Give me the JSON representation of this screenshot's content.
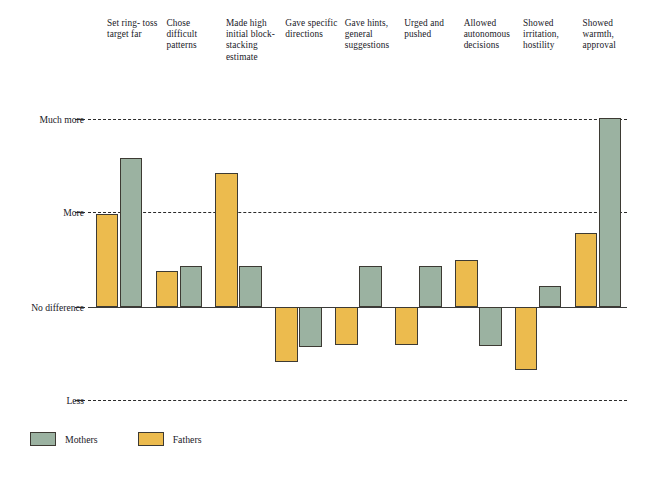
{
  "chart_data": {
    "type": "bar",
    "title": "",
    "subtitle": "",
    "xlabel": "",
    "ylabel": "",
    "orientation": "vertical",
    "grid": true,
    "legend_position": "bottom-left",
    "categories": [
      "Set ring-toss target far",
      "Chose difficult patterns",
      "Made high initial block-stacking estimate",
      "Gave specific directions",
      "Gave hints, general suggestions",
      "Urged and pushed",
      "Allowed autonomous decisions",
      "Showed irritation, hostility",
      "Showed warmth, approval"
    ],
    "category_labels": [
      "Set ring-\ntoss\ntarget\nfar",
      "Chose\ndifficult\npatterns",
      "Made\nhigh\ninitial\nblock-\nstacking\nestimate",
      "Gave\nspecific\ndirections",
      "Gave\nhints,\ngeneral\nsuggestions",
      "Urged\nand\npushed",
      "Allowed\nautonomous\ndecisions",
      "Showed\nirritation,\nhostility",
      "Showed\nwarmth,\napproval"
    ],
    "y_tick_labels": [
      "Much more",
      "More",
      "No difference",
      "Less"
    ],
    "y_tick_values": [
      2,
      1,
      0,
      -1
    ],
    "ylim": [
      -1,
      2
    ],
    "series": [
      {
        "name": "Mothers",
        "color": "#9bb2a1",
        "values": [
          1.58,
          0.43,
          0.43,
          -0.42,
          0.43,
          0.43,
          -0.41,
          0.22,
          2.0
        ]
      },
      {
        "name": "Fathers",
        "color": "#ecbb4e",
        "values": [
          0.98,
          0.38,
          1.42,
          -0.58,
          -0.4,
          -0.4,
          0.5,
          -0.67,
          0.78
        ]
      }
    ]
  },
  "legend": {
    "items": [
      {
        "label": "Mothers",
        "color": "#9bb2a1"
      },
      {
        "label": "Fathers",
        "color": "#ecbb4e"
      }
    ]
  },
  "axis": {
    "much_more": "Much more",
    "more": "More",
    "no_difference": "No difference",
    "less": "Less"
  }
}
